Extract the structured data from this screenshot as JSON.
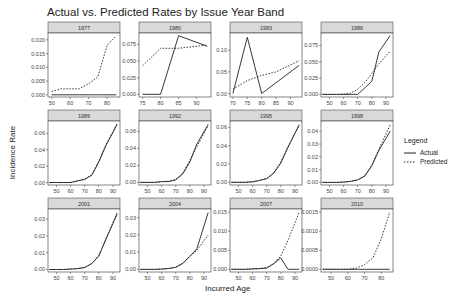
{
  "title": "Actual vs. Predicted Rates by Issue Year Band",
  "xlabel": "Incurred Age",
  "ylabel": "Incidence Rate",
  "legend": {
    "title": "Legend",
    "items": [
      {
        "label": "Actual",
        "style": "solid"
      },
      {
        "label": "Predicted",
        "style": "dotted"
      }
    ]
  },
  "colors": {
    "line": "#222222",
    "strip": "#d9d9d9",
    "panel_border": "#333333"
  },
  "chart_data": {
    "type": "line",
    "title": "Actual vs. Predicted Rates by Issue Year Band",
    "xlabel": "Incurred Age",
    "ylabel": "Incidence Rate",
    "legend_position": "right",
    "grid": false,
    "facets": [
      {
        "label": "1977",
        "xlim": [
          48,
          87
        ],
        "xticks": [
          50,
          60,
          70,
          80
        ],
        "ylim": [
          -0.0008,
          0.0225
        ],
        "yticks": [
          0.0,
          0.005,
          0.01,
          0.015,
          0.02
        ],
        "ytick_labels": [
          "0.000",
          "0.005",
          "0.010",
          "0.015",
          "0.020"
        ],
        "series": [
          {
            "name": "Actual",
            "x": [
              50,
              55,
              60,
              65,
              70,
              75,
              80,
              85
            ],
            "y": [
              0,
              0,
              0,
              0,
              0,
              0,
              0,
              0
            ]
          },
          {
            "name": "Predicted",
            "x": [
              50,
              55,
              60,
              65,
              70,
              75,
              80,
              85
            ],
            "y": [
              0.0012,
              0.0022,
              0.0022,
              0.0022,
              0.004,
              0.0065,
              0.018,
              0.0215
            ]
          }
        ]
      },
      {
        "label": "1980",
        "xlim": [
          74,
          94
        ],
        "xticks": [
          75,
          80,
          85,
          90
        ],
        "ylim": [
          -0.004,
          0.092
        ],
        "yticks": [
          0,
          0.025,
          0.05,
          0.075
        ],
        "ytick_labels": [
          "0.000",
          "0.025",
          "0.050",
          "0.075"
        ],
        "series": [
          {
            "name": "Actual",
            "x": [
              75,
              80,
              85,
              93
            ],
            "y": [
              0,
              0,
              0.088,
              0.072
            ]
          },
          {
            "name": "Predicted",
            "x": [
              75,
              80,
              85,
              93
            ],
            "y": [
              0.043,
              0.069,
              0.069,
              0.074
            ]
          }
        ]
      },
      {
        "label": "1983",
        "xlim": [
          69,
          94
        ],
        "xticks": [
          70,
          75,
          80,
          85,
          90
        ],
        "ylim": [
          -0.008,
          0.14
        ],
        "yticks": [
          0,
          0.05,
          0.1
        ],
        "ytick_labels": [
          "0.00",
          "0.05",
          "0.10"
        ],
        "series": [
          {
            "name": "Actual",
            "x": [
              70,
              75,
              80,
              93
            ],
            "y": [
              0,
              0.13,
              0,
              0.065
            ]
          },
          {
            "name": "Predicted",
            "x": [
              70,
              75,
              80,
              85,
              93
            ],
            "y": [
              0.01,
              0.03,
              0.042,
              0.05,
              0.076
            ]
          }
        ]
      },
      {
        "label": "1986",
        "xlim": [
          44,
          95
        ],
        "xticks": [
          50,
          60,
          70,
          80,
          90
        ],
        "ylim": [
          -0.004,
          0.094
        ],
        "yticks": [
          0,
          0.025,
          0.05,
          0.075
        ],
        "ytick_labels": [
          "0.000",
          "0.025",
          "0.050",
          "0.075"
        ],
        "series": [
          {
            "name": "Actual",
            "x": [
              45,
              50,
              55,
              60,
              65,
              70,
              75,
              80,
              85,
              93
            ],
            "y": [
              0,
              0,
              0,
              0,
              0,
              0,
              0.01,
              0.02,
              0.065,
              0.09
            ]
          },
          {
            "name": "Predicted",
            "x": [
              45,
              50,
              55,
              60,
              65,
              70,
              75,
              80,
              85,
              93
            ],
            "y": [
              0,
              0,
              0,
              0.0005,
              0.002,
              0.008,
              0.018,
              0.032,
              0.047,
              0.066
            ]
          }
        ]
      },
      {
        "label": "1989",
        "xlim": [
          44,
          95
        ],
        "xticks": [
          50,
          60,
          70,
          80,
          90
        ],
        "ylim": [
          -0.003,
          0.075
        ],
        "yticks": [
          0,
          0.02,
          0.04,
          0.06
        ],
        "ytick_labels": [
          "0.00",
          "0.02",
          "0.04",
          "0.06"
        ],
        "series": [
          {
            "name": "Actual",
            "x": [
              45,
              50,
              55,
              60,
              65,
              70,
              75,
              80,
              85,
              93
            ],
            "y": [
              0,
              0,
              0,
              0,
              0.002,
              0.004,
              0.009,
              0.025,
              0.045,
              0.071
            ]
          },
          {
            "name": "Predicted",
            "x": [
              45,
              50,
              55,
              60,
              65,
              70,
              75,
              80,
              85,
              93
            ],
            "y": [
              0,
              0,
              0,
              0,
              0.002,
              0.004,
              0.0095,
              0.026,
              0.046,
              0.072
            ]
          }
        ]
      },
      {
        "label": "1992",
        "xlim": [
          44,
          95
        ],
        "xticks": [
          50,
          60,
          70,
          80,
          90
        ],
        "ylim": [
          -0.003,
          0.072
        ],
        "yticks": [
          0,
          0.02,
          0.04,
          0.06
        ],
        "ytick_labels": [
          "0.00",
          "0.02",
          "0.04",
          "0.06"
        ],
        "series": [
          {
            "name": "Actual",
            "x": [
              45,
              50,
              55,
              60,
              65,
              70,
              75,
              80,
              85,
              93
            ],
            "y": [
              0,
              0,
              0,
              0.001,
              0.001,
              0.003,
              0.01,
              0.024,
              0.045,
              0.068
            ]
          },
          {
            "name": "Predicted",
            "x": [
              45,
              50,
              55,
              60,
              65,
              70,
              75,
              80,
              85,
              93
            ],
            "y": [
              0,
              0,
              0,
              0.001,
              0.0015,
              0.0035,
              0.011,
              0.026,
              0.042,
              0.067
            ]
          }
        ]
      },
      {
        "label": "1995",
        "xlim": [
          44,
          95
        ],
        "xticks": [
          50,
          60,
          70,
          80,
          90
        ],
        "ylim": [
          -0.003,
          0.067
        ],
        "yticks": [
          0,
          0.02,
          0.04,
          0.06
        ],
        "ytick_labels": [
          "0.00",
          "0.02",
          "0.04",
          "0.06"
        ],
        "series": [
          {
            "name": "Actual",
            "x": [
              45,
              50,
              55,
              60,
              65,
              70,
              75,
              80,
              85,
              93
            ],
            "y": [
              0,
              0,
              0,
              0.0005,
              0.002,
              0.004,
              0.01,
              0.021,
              0.038,
              0.063
            ]
          },
          {
            "name": "Predicted",
            "x": [
              45,
              50,
              55,
              60,
              65,
              70,
              75,
              80,
              85,
              93
            ],
            "y": [
              0,
              0,
              0,
              0.0005,
              0.002,
              0.004,
              0.0105,
              0.022,
              0.039,
              0.062
            ]
          }
        ]
      },
      {
        "label": "1998",
        "xlim": [
          44,
          95
        ],
        "xticks": [
          50,
          60,
          70,
          80,
          90
        ],
        "ylim": [
          -0.002,
          0.048
        ],
        "yticks": [
          0,
          0.01,
          0.02,
          0.03,
          0.04
        ],
        "ytick_labels": [
          "0.00",
          "0.01",
          "0.02",
          "0.03",
          "0.04"
        ],
        "series": [
          {
            "name": "Actual",
            "x": [
              45,
              50,
              55,
              60,
              65,
              70,
              75,
              80,
              85,
              93
            ],
            "y": [
              0,
              0,
              0,
              0.0003,
              0.0008,
              0.002,
              0.005,
              0.013,
              0.025,
              0.04
            ]
          },
          {
            "name": "Predicted",
            "x": [
              45,
              50,
              55,
              60,
              65,
              70,
              75,
              80,
              85,
              93
            ],
            "y": [
              0,
              0,
              0,
              0.0003,
              0.0008,
              0.002,
              0.0052,
              0.0135,
              0.026,
              0.045
            ]
          }
        ]
      },
      {
        "label": "2001",
        "xlim": [
          44,
          95
        ],
        "xticks": [
          50,
          60,
          70,
          80,
          90
        ],
        "ylim": [
          -0.0015,
          0.036
        ],
        "yticks": [
          0,
          0.01,
          0.02,
          0.03
        ],
        "ytick_labels": [
          "0.00",
          "0.01",
          "0.02",
          "0.03"
        ],
        "series": [
          {
            "name": "Actual",
            "x": [
              45,
              50,
              55,
              60,
              65,
              70,
              75,
              80,
              85,
              93
            ],
            "y": [
              0,
              0,
              0,
              0.0002,
              0.0005,
              0.0012,
              0.0035,
              0.008,
              0.018,
              0.033
            ]
          },
          {
            "name": "Predicted",
            "x": [
              45,
              50,
              55,
              60,
              65,
              70,
              75,
              80,
              85,
              93
            ],
            "y": [
              0,
              0,
              0,
              0.0002,
              0.0005,
              0.0012,
              0.0036,
              0.0082,
              0.018,
              0.034
            ]
          }
        ]
      },
      {
        "label": "2004",
        "xlim": [
          44,
          95
        ],
        "xticks": [
          50,
          60,
          70,
          80,
          90
        ],
        "ylim": [
          -0.0015,
          0.035
        ],
        "yticks": [
          0,
          0.01,
          0.02,
          0.03
        ],
        "ytick_labels": [
          "0.00",
          "0.01",
          "0.02",
          "0.03"
        ],
        "series": [
          {
            "name": "Actual",
            "x": [
              45,
              50,
              55,
              60,
              65,
              70,
              75,
              80,
              85,
              93
            ],
            "y": [
              0,
              0,
              0,
              0.0002,
              0.0005,
              0.0012,
              0.0035,
              0.0075,
              0.012,
              0.033
            ]
          },
          {
            "name": "Predicted",
            "x": [
              45,
              50,
              55,
              60,
              65,
              70,
              75,
              80,
              85,
              93
            ],
            "y": [
              0,
              0,
              0,
              0.0002,
              0.0005,
              0.0012,
              0.0036,
              0.0078,
              0.011,
              0.02
            ]
          }
        ]
      },
      {
        "label": "2007",
        "xlim": [
          44,
          95
        ],
        "xticks": [
          50,
          60,
          70,
          80,
          90
        ],
        "ylim": [
          -0.0007,
          0.0158
        ],
        "yticks": [
          0,
          0.005,
          0.01,
          0.015
        ],
        "ytick_labels": [
          "0.000",
          "0.005",
          "0.010",
          "0.015"
        ],
        "series": [
          {
            "name": "Actual",
            "x": [
              45,
              50,
              55,
              60,
              65,
              70,
              75,
              80,
              85,
              93
            ],
            "y": [
              0,
              0,
              0,
              0.0001,
              0.0002,
              0.0003,
              0.0015,
              0.003,
              0,
              0
            ]
          },
          {
            "name": "Predicted",
            "x": [
              45,
              50,
              55,
              60,
              65,
              70,
              75,
              80,
              85,
              93
            ],
            "y": [
              0,
              0,
              0,
              0.0001,
              0.0002,
              0.0005,
              0.0015,
              0.0035,
              0.0075,
              0.015
            ]
          }
        ]
      },
      {
        "label": "2010",
        "xlim": [
          44,
          87
        ],
        "xticks": [
          50,
          60,
          70,
          80
        ],
        "ylim": [
          -7e-05,
          0.00158
        ],
        "yticks": [
          0,
          0.0005,
          0.001,
          0.0015
        ],
        "ytick_labels": [
          "0.0000",
          "0.0005",
          "0.0010",
          "0.0015"
        ],
        "series": [
          {
            "name": "Actual",
            "x": [
              45,
              50,
              55,
              60,
              65,
              70,
              75,
              80,
              85
            ],
            "y": [
              0,
              0,
              0,
              0,
              0,
              0,
              0,
              0,
              0
            ]
          },
          {
            "name": "Predicted",
            "x": [
              45,
              50,
              55,
              60,
              65,
              70,
              75,
              80,
              85
            ],
            "y": [
              0,
              0,
              0,
              0,
              3e-05,
              0.00012,
              0.0003,
              0.0008,
              0.0015
            ]
          }
        ]
      }
    ]
  }
}
